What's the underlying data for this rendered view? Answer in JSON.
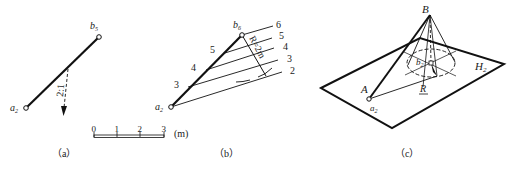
{
  "figure_a": {
    "caption": "（a）",
    "point_top": "b",
    "point_top_sub": "5",
    "point_bottom": "a",
    "point_bottom_sub": "2",
    "slope_label": "2:1",
    "scale": {
      "ticks": [
        "0",
        "1",
        "2",
        "3"
      ],
      "unit": "(m)"
    }
  },
  "figure_b": {
    "caption": "（b）",
    "point_top": "b",
    "point_top_sub": "6",
    "point_bottom": "a",
    "point_bottom_sub": "2",
    "radius_label": "R=2m",
    "line_marks": [
      "3",
      "4",
      "5"
    ],
    "contour_labels": [
      "6",
      "5",
      "4",
      "3",
      "2"
    ]
  },
  "figure_c": {
    "caption": "（c）",
    "apex": "B",
    "point_A": "A",
    "point_a": "a",
    "point_a_sub": "2",
    "point_b": "b",
    "point_b_sub": "2",
    "plane": "H",
    "plane_sub": "2",
    "radius": "R"
  }
}
